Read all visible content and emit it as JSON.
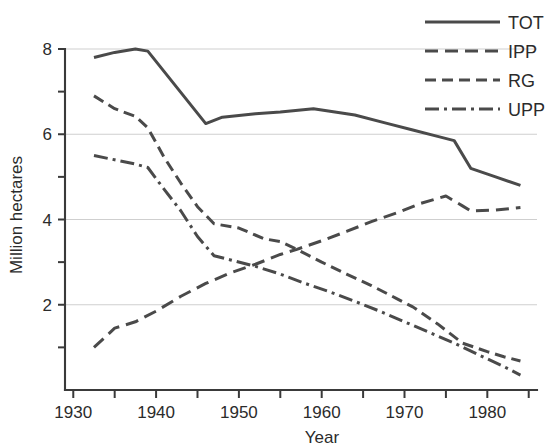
{
  "chart_data": {
    "type": "line",
    "title": "",
    "xlabel": "Year",
    "ylabel": "Million hectares",
    "xlim": [
      1929,
      1986
    ],
    "ylim": [
      0,
      8.35
    ],
    "grid": "horizontal",
    "legend_position": "top-right",
    "x_ticks_major": [
      1930,
      1940,
      1950,
      1960,
      1970,
      1980
    ],
    "x_tick_labels": [
      "1930",
      "1940",
      "1950",
      "1960",
      "1970",
      "1980"
    ],
    "x_ticks_minor": [
      1935,
      1945,
      1955,
      1965,
      1975,
      1985
    ],
    "y_ticks_major": [
      2,
      4,
      6,
      8
    ],
    "y_tick_labels": [
      "2",
      "4",
      "6",
      "8"
    ],
    "y_ticks_minor": [
      1,
      3,
      5,
      7
    ],
    "series": [
      {
        "name": "TOT",
        "style": "solid",
        "x": [
          1932.5,
          1935,
          1937.5,
          1939,
          1946,
          1948,
          1952,
          1955,
          1959,
          1964,
          1968,
          1971,
          1974,
          1976,
          1978,
          1981,
          1984
        ],
        "values": [
          7.8,
          7.92,
          8.0,
          7.95,
          6.25,
          6.4,
          6.48,
          6.52,
          6.6,
          6.45,
          6.25,
          6.1,
          5.95,
          5.85,
          5.2,
          5.0,
          4.8
        ]
      },
      {
        "name": "IPP",
        "style": "dashed",
        "x": [
          1932.5,
          1935,
          1937.5,
          1940,
          1943,
          1946,
          1949,
          1952,
          1955,
          1957,
          1960,
          1963,
          1966,
          1969,
          1972,
          1975,
          1977,
          1978,
          1981,
          1984
        ],
        "values": [
          1.0,
          1.45,
          1.6,
          1.85,
          2.2,
          2.5,
          2.75,
          2.95,
          3.18,
          3.3,
          3.5,
          3.72,
          3.95,
          4.15,
          4.38,
          4.55,
          4.32,
          4.2,
          4.22,
          4.28
        ]
      },
      {
        "name": "RG",
        "style": "dotted",
        "x": [
          1932.5,
          1935,
          1937.5,
          1939,
          1941,
          1943,
          1945,
          1947,
          1950,
          1953,
          1955,
          1957,
          1960,
          1963,
          1966,
          1969,
          1971,
          1974,
          1977,
          1980,
          1982,
          1984
        ],
        "values": [
          6.9,
          6.6,
          6.42,
          6.15,
          5.45,
          4.85,
          4.3,
          3.9,
          3.8,
          3.55,
          3.48,
          3.3,
          3.0,
          2.72,
          2.45,
          2.15,
          1.95,
          1.55,
          1.1,
          0.9,
          0.78,
          0.68
        ]
      },
      {
        "name": "UPP",
        "style": "dashdot",
        "x": [
          1932.5,
          1935,
          1937.5,
          1939,
          1941,
          1943,
          1945,
          1947,
          1949,
          1952,
          1955,
          1958,
          1961,
          1964,
          1967,
          1970,
          1973,
          1976,
          1979,
          1982,
          1984
        ],
        "values": [
          5.5,
          5.4,
          5.3,
          5.22,
          4.7,
          4.2,
          3.6,
          3.15,
          3.05,
          2.9,
          2.72,
          2.5,
          2.3,
          2.08,
          1.85,
          1.6,
          1.35,
          1.1,
          0.82,
          0.55,
          0.35
        ]
      }
    ]
  },
  "legend": {
    "items": [
      {
        "label": "TOT",
        "style": "solid"
      },
      {
        "label": "IPP",
        "style": "dashed"
      },
      {
        "label": "RG",
        "style": "dotted"
      },
      {
        "label": "UPP",
        "style": "dashdot"
      }
    ]
  },
  "axes": {
    "x_title": "Year",
    "y_title": "Million hectares"
  },
  "colors": {
    "line": "#4a4a4a",
    "axis": "#3a3a3a",
    "grid": "#cfcfcf",
    "text": "#2b2b2b",
    "background": "#ffffff"
  }
}
